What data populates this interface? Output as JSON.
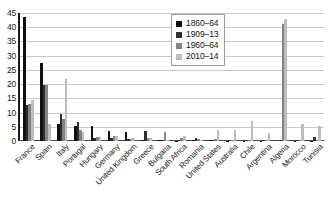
{
  "chart_data": {
    "type": "bar",
    "title": "",
    "xlabel": "",
    "ylabel": "",
    "ylim": [
      0,
      45
    ],
    "ytick_step": 5,
    "grid": true,
    "legend_position": "top-right",
    "categories": [
      "France",
      "Spain",
      "Italy",
      "Portugal",
      "Hungary",
      "Germany",
      "United Kingdom",
      "Greece",
      "Bulgaria",
      "South Africa",
      "Romania",
      "United States",
      "Australia",
      "Chile",
      "Argentina",
      "Algeria",
      "Morocco",
      "Tunisia"
    ],
    "yticks": [
      "0",
      "5",
      "10",
      "15",
      "20",
      "25",
      "30",
      "35",
      "40",
      "45"
    ],
    "series": [
      {
        "name": "1860–64",
        "color": "#111111",
        "values": [
          43.5,
          27.4,
          5.9,
          5.4,
          5.2,
          3.5,
          3.1,
          0.4,
          0.2,
          0.1,
          0.2,
          0.3,
          0.1,
          0.1,
          0.1,
          0.0,
          0.1,
          0.1
        ]
      },
      {
        "name": "1909–13",
        "color": "#2e2e2e",
        "values": [
          12.6,
          19.8,
          9.6,
          6.6,
          1.2,
          1.1,
          0.6,
          3.6,
          0.3,
          0.3,
          1.0,
          0.2,
          0.2,
          0.2,
          0.2,
          0.3,
          0.2,
          1.3
        ]
      },
      {
        "name": "1960–64",
        "color": "#848484",
        "values": [
          12.9,
          19.6,
          7.6,
          4.0,
          1.4,
          1.6,
          0.6,
          1.0,
          3.2,
          0.9,
          0.8,
          0.6,
          0.4,
          0.3,
          0.3,
          41.0,
          0.5,
          0.3
        ]
      },
      {
        "name": "2010–14",
        "color": "#bdbdbd",
        "values": [
          14.4,
          5.9,
          21.8,
          3.1,
          1.3,
          1.9,
          0.9,
          1.0,
          0.4,
          1.6,
          0.5,
          3.7,
          4.0,
          7.2,
          2.9,
          43.0,
          5.9,
          5.2
        ]
      }
    ]
  },
  "legend": {
    "items": [
      {
        "label": "1860–64"
      },
      {
        "label": "1909–13"
      },
      {
        "label": "1960–64"
      },
      {
        "label": "2010–14"
      }
    ]
  }
}
